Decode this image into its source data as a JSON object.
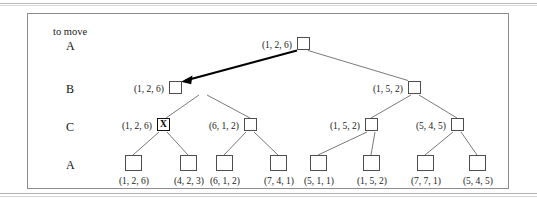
{
  "figure": {
    "caption_note": "to move",
    "row_labels": [
      "A",
      "B",
      "C",
      "A"
    ],
    "marker_text": "X",
    "colors": {
      "frame": "#8c8c8c",
      "node_stroke": "#4d4d4d",
      "edge": "#6b6b6b",
      "highlight_edge": "#000000",
      "text": "#1a1a1a"
    },
    "levels": [
      {
        "level_label": "A",
        "nodes": [
          {
            "label": "(1, 2, 6)",
            "marked": false
          }
        ]
      },
      {
        "level_label": "B",
        "nodes": [
          {
            "label": "(1, 2, 6)",
            "marked": false
          },
          {
            "label": "(1, 5, 2)",
            "marked": false
          }
        ]
      },
      {
        "level_label": "C",
        "nodes": [
          {
            "label": "(1, 2, 6)",
            "marked": true
          },
          {
            "label": "(6, 1, 2)",
            "marked": false
          },
          {
            "label": "(1, 5, 2)",
            "marked": false
          },
          {
            "label": "(5, 4, 5)",
            "marked": false
          }
        ]
      },
      {
        "level_label": "A",
        "nodes": [
          {
            "label": "(1, 2, 6)",
            "marked": false
          },
          {
            "label": "(4, 2, 3)",
            "marked": false
          },
          {
            "label": "(6, 1, 2)",
            "marked": false
          },
          {
            "label": "(7, 4, 1)",
            "marked": false
          },
          {
            "label": "(5, 1, 1)",
            "marked": false
          },
          {
            "label": "(1, 5, 2)",
            "marked": false
          },
          {
            "label": "(7, 7, 1)",
            "marked": false
          },
          {
            "label": "(5, 4, 5)",
            "marked": false
          }
        ]
      }
    ],
    "root_label": "(1, 2, 6)",
    "b_left_label": "(1, 2, 6)",
    "b_right_label": "(1, 5, 2)",
    "c1_label": "(1, 2, 6)",
    "c2_label": "(6, 1, 2)",
    "c3_label": "(1, 5, 2)",
    "c4_label": "(5, 4, 5)",
    "leaf1_label": "(1, 2, 6)",
    "leaf2_label": "(4, 2, 3)",
    "leaf3_label": "(6, 1, 2)",
    "leaf4_label": "(7, 4, 1)",
    "leaf5_label": "(5, 1, 1)",
    "leaf6_label": "(1, 5, 2)",
    "leaf7_label": "(7, 7, 1)",
    "leaf8_label": "(5, 4, 5)",
    "row_label_1": "A",
    "row_label_2": "B",
    "row_label_3": "C",
    "row_label_4": "A"
  }
}
